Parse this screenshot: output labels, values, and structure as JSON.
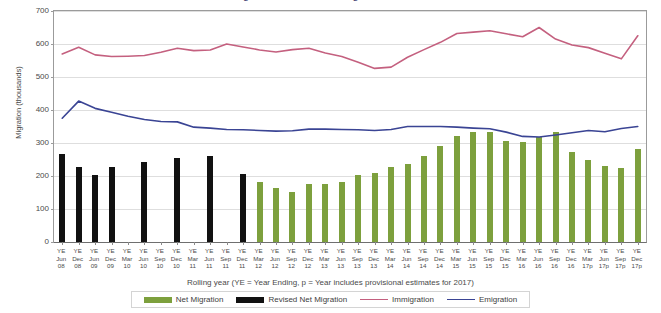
{
  "title": {
    "cut_off_title": "Long-term international migration estimates"
  },
  "axes": {
    "y_title": "Migration (thousands)",
    "x_caption": "Rolling year (YE = Year Ending, p = Year includes provisional estimates for 2017)",
    "y_ticks": [
      0,
      100,
      200,
      300,
      400,
      500,
      600,
      700
    ],
    "y_min": 0,
    "y_max": 700
  },
  "legend": {
    "items": [
      {
        "label": "Net Migration",
        "color": "#7da03d",
        "kind": "bar"
      },
      {
        "label": "Revised Net Migration",
        "color": "#111111",
        "kind": "bar"
      },
      {
        "label": "Immigration",
        "color": "#c4607f",
        "kind": "line"
      },
      {
        "label": "Emigration",
        "color": "#3a4494",
        "kind": "line"
      }
    ]
  },
  "colors": {
    "net_migration": "#7da03d",
    "revised_net_migration": "#111111",
    "immigration": "#c4607f",
    "emigration": "#3a4494",
    "gridline": "#dedede",
    "axis": "#9b9b9b"
  },
  "chart_data": {
    "type": "bar",
    "title": "Long-term international migration estimates",
    "xlabel": "Rolling year (YE = Year Ending, p = Year includes provisional estimates for 2017)",
    "ylabel": "Migration (thousands)",
    "ylim": [
      0,
      700
    ],
    "ytick_step": 100,
    "grid": true,
    "legend_position": "bottom",
    "categories": [
      "YE Jun 08",
      "YE Dec 08",
      "YE Jun 09",
      "YE Dec 09",
      "YE Mar 10",
      "YE Jun 10",
      "YE Sep 10",
      "YE Dec 10",
      "YE Mar 11",
      "YE Jun 11",
      "YE Sep 11",
      "YE Dec 11",
      "YE Mar 12",
      "YE Jun 12",
      "YE Sep 12",
      "YE Dec 12",
      "YE Mar 13",
      "YE Jun 13",
      "YE Sep 13",
      "YE Dec 13",
      "YE Mar 14",
      "YE Jun 14",
      "YE Sep 14",
      "YE Dec 14",
      "YE Mar 15",
      "YE Jun 15",
      "YE Sep 15",
      "YE Dec 15",
      "YE Mar 16",
      "YE Jun 16",
      "YE Sep 16",
      "YE Dec 16",
      "YE Mar 17p",
      "YE Jun 17p",
      "YE Sep 17p",
      "YE Dec 17p"
    ],
    "category_lines": [
      [
        "YE",
        "Jun",
        "08"
      ],
      [
        "YE",
        "Dec",
        "08"
      ],
      [
        "YE",
        "Jun",
        "09"
      ],
      [
        "YE",
        "Dec",
        "09"
      ],
      [
        "YE",
        "Mar",
        "10"
      ],
      [
        "YE",
        "Jun",
        "10"
      ],
      [
        "YE",
        "Sep",
        "10"
      ],
      [
        "YE",
        "Dec",
        "10"
      ],
      [
        "YE",
        "Mar",
        "11"
      ],
      [
        "YE",
        "Jun",
        "11"
      ],
      [
        "YE",
        "Sep",
        "11"
      ],
      [
        "YE",
        "Dec",
        "11"
      ],
      [
        "YE",
        "Mar",
        "12"
      ],
      [
        "YE",
        "Jun",
        "12"
      ],
      [
        "YE",
        "Sep",
        "12"
      ],
      [
        "YE",
        "Dec",
        "12"
      ],
      [
        "YE",
        "Mar",
        "13"
      ],
      [
        "YE",
        "Jun",
        "13"
      ],
      [
        "YE",
        "Sep",
        "13"
      ],
      [
        "YE",
        "Dec",
        "13"
      ],
      [
        "YE",
        "Mar",
        "14"
      ],
      [
        "YE",
        "Jun",
        "14"
      ],
      [
        "YE",
        "Sep",
        "14"
      ],
      [
        "YE",
        "Dec",
        "14"
      ],
      [
        "YE",
        "Mar",
        "15"
      ],
      [
        "YE",
        "Jun",
        "15"
      ],
      [
        "YE",
        "Sep",
        "15"
      ],
      [
        "YE",
        "Dec",
        "15"
      ],
      [
        "YE",
        "Mar",
        "16"
      ],
      [
        "YE",
        "Jun",
        "16"
      ],
      [
        "YE",
        "Sep",
        "16"
      ],
      [
        "YE",
        "Dec",
        "16"
      ],
      [
        "YE",
        "Mar",
        "17p"
      ],
      [
        "YE",
        "Jun",
        "17p"
      ],
      [
        "YE",
        "Sep",
        "17p"
      ],
      [
        "YE",
        "Dec",
        "17p"
      ]
    ],
    "series": [
      {
        "name": "Revised Net Migration",
        "type": "bar",
        "color": "#111111",
        "values": [
          266,
          227,
          204,
          228,
          null,
          243,
          null,
          256,
          null,
          262,
          null,
          205,
          null,
          null,
          null,
          null,
          null,
          null,
          null,
          null,
          null,
          null,
          null,
          null,
          null,
          null,
          null,
          null,
          null,
          null,
          null,
          null,
          null,
          null,
          null,
          null
        ]
      },
      {
        "name": "Net Migration",
        "type": "bar",
        "color": "#7da03d",
        "values": [
          null,
          null,
          null,
          null,
          null,
          null,
          null,
          null,
          null,
          null,
          null,
          null,
          183,
          165,
          153,
          177,
          175,
          182,
          202,
          210,
          228,
          237,
          260,
          290,
          322,
          334,
          334,
          305,
          302,
          318,
          332,
          273,
          250,
          230,
          224,
          282
        ]
      },
      {
        "name": "Immigration",
        "type": "line",
        "color": "#c4607f",
        "values": [
          570,
          590,
          567,
          562,
          563,
          565,
          575,
          587,
          580,
          582,
          600,
          591,
          582,
          576,
          583,
          587,
          573,
          562,
          545,
          526,
          530,
          560,
          583,
          605,
          632,
          636,
          640,
          631,
          622,
          650,
          615,
          597,
          589,
          572,
          555,
          625
        ]
      },
      {
        "name": "Emigration",
        "type": "line",
        "color": "#3a4494",
        "values": [
          375,
          427,
          405,
          393,
          381,
          371,
          365,
          364,
          348,
          345,
          341,
          340,
          338,
          336,
          337,
          342,
          342,
          341,
          340,
          338,
          341,
          350,
          350,
          350,
          348,
          345,
          343,
          333,
          320,
          318,
          324,
          331,
          338,
          334,
          344,
          350
        ]
      }
    ]
  }
}
